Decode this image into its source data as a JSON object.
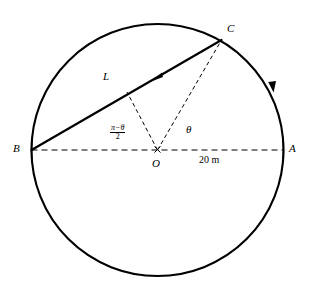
{
  "figure": {
    "type": "circle-geometry-diagram",
    "title": "",
    "background_color": "#ffffff",
    "stroke_color": "#000000"
  },
  "circle": {
    "center_label": "O",
    "center_x": 157.5,
    "center_y": 150,
    "radius": 126,
    "stroke_width": 2.0
  },
  "points": [
    {
      "name": "A",
      "label": "A",
      "x": 283.5,
      "y": 150,
      "label_x": 289,
      "label_y": 144
    },
    {
      "name": "B",
      "label": "B",
      "x": 31.5,
      "y": 150,
      "label_x": 14,
      "label_y": 144
    },
    {
      "name": "C",
      "label": "C",
      "x": 221.5,
      "y": 40,
      "label_x": 227,
      "label_y": 25
    },
    {
      "name": "O",
      "label": "O",
      "x": 157.5,
      "y": 150,
      "label_x": 153,
      "label_y": 157
    }
  ],
  "segments": {
    "chord_BC": {
      "label": "L",
      "label_x": 104,
      "label_y": 75,
      "from": "B",
      "to": "C",
      "style": "solid",
      "stroke_width": 2.0,
      "arrow": {
        "x": 158,
        "y": 78,
        "direction": "toward-B"
      }
    },
    "diameter_BA": {
      "style": "dashed",
      "stroke_width": 1.1,
      "dash": "6 4",
      "length_label": "20 m",
      "length_label_x": 200,
      "length_label_y": 159
    },
    "radius_OC": {
      "style": "dashed",
      "stroke_width": 1.0,
      "dash": "4 3"
    },
    "radius_O_to_chord": {
      "style": "dashed",
      "stroke_width": 1.0,
      "dash": "4 3",
      "end_x": 127,
      "end_y": 92
    }
  },
  "angles": {
    "theta": {
      "label": "θ",
      "label_x": 186,
      "label_y": 129,
      "description": "angle AOC at center between OA and OC"
    },
    "half_pi_minus_theta": {
      "numerator": "π−θ",
      "denominator": "2",
      "label_x": 113,
      "label_y": 128,
      "description": "angle between OB and the dashed radius to chord"
    }
  },
  "arc_arrow": {
    "x": 272,
    "y": 87,
    "direction": "clockwise-from-C-toward-A"
  }
}
